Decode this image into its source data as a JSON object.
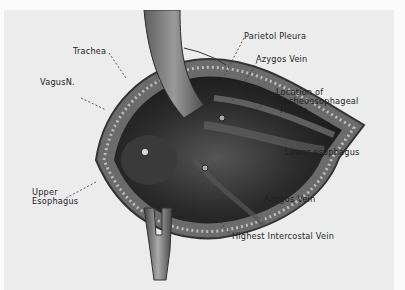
{
  "figure": {
    "labels": {
      "trachea": "Trachea",
      "vagus": "VagusN.",
      "parietal_pleura": "Parietol Pleura",
      "azygos_upper": "Azygos Vein",
      "fistula_line1": "Location of",
      "fistula_line2": "Tracheoesophageal",
      "fistula_line3": "Fistula",
      "lower_esophagus": "Lower esophagus",
      "upper_esophagus_line1": "Upper",
      "upper_esophagus_line2": "Esophagus",
      "azygos_lower": "Azygos Vein",
      "highest_intercostal": "Highest Intercostal Vein"
    },
    "colors": {
      "background": "#fbfbfb",
      "plate": "#ececec",
      "tissue_dark": "#2a2a2a",
      "tissue_mid": "#5a5a5a",
      "retractor": "#8a8a8a",
      "label_text": "#1e1e1e"
    }
  }
}
